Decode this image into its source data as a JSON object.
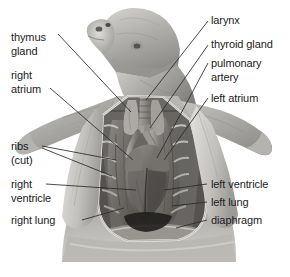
{
  "figure": {
    "background_color": "#ffffff",
    "label_color": "#1c1c1c",
    "leader_color": "#2b2b2b",
    "style": "grayscale halftone anatomical illustration"
  },
  "labels": {
    "thymus_gland_line1": "thymus",
    "thymus_gland_line2": "gland",
    "right_atrium_line1": "right",
    "right_atrium_line2": "atrium",
    "ribs_line1": "ribs",
    "ribs_line2": "(cut)",
    "right_ventricle_line1": "right",
    "right_ventricle_line2": "ventricle",
    "right_lung": "right lung",
    "larynx": "larynx",
    "thyroid_gland": "thyroid gland",
    "pulmonary_artery_line1": "pulmonary",
    "pulmonary_artery_line2": "artery",
    "left_atrium": "left atrium",
    "left_ventricle": "left ventricle",
    "left_lung": "left lung",
    "diaphragm": "diaphragm"
  }
}
